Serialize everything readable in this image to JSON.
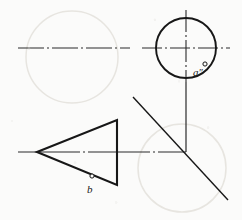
{
  "figure": {
    "background_color": "#fbfbfa",
    "ink_color": "#171717",
    "centerline_color": "#2a2a2a",
    "ghost_color": "#e7e5e0",
    "width": 242,
    "height": 220
  },
  "labels": {
    "point_a": {
      "text": "a",
      "prime": "″",
      "marker": "open-circle",
      "marker_x": 205,
      "marker_y": 64,
      "x": 193,
      "y": 67
    },
    "point_b": {
      "text": "b",
      "prime": "",
      "marker": "open-circle",
      "marker_x": 92,
      "marker_y": 176,
      "x": 87,
      "y": 184
    }
  },
  "geometry": {
    "circle": {
      "name": "top-right-circle",
      "cx": 186,
      "cy": 48,
      "r": 30,
      "stroke_width": 1.9
    },
    "triangle": {
      "name": "left-pointing-triangle",
      "points": "37,152 117,120 117,185",
      "stroke_width": 2.1
    },
    "vertical_axis": {
      "x": 186,
      "y_top": 10,
      "y_bottom": 152
    },
    "lower_horizontal_axis": {
      "y": 152,
      "x_start": 18,
      "x_end": 186
    },
    "upper_centerline_left": {
      "y": 48,
      "x_start": 18,
      "x_end": 130
    },
    "upper_centerline_right": {
      "y": 48,
      "x_start": 142,
      "x_end": 230
    },
    "diagonal": {
      "x1": 133,
      "y1": 97,
      "x2": 228,
      "y2": 200
    },
    "ghost_circles": [
      {
        "name": "ghost-circle-top-left",
        "cx": 72,
        "cy": 57,
        "r": 46
      },
      {
        "name": "ghost-circle-bottom-right",
        "cx": 182,
        "cy": 168,
        "r": 44
      }
    ]
  }
}
